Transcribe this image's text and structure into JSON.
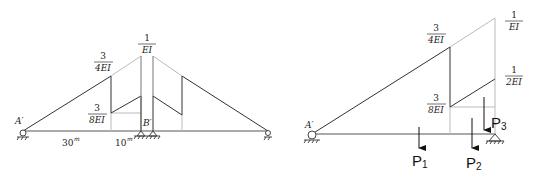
{
  "left_diagram": {
    "labels": {
      "peak": {
        "num": "1",
        "den": "EI"
      },
      "upper": {
        "num": "3",
        "den": "4EI"
      },
      "lower": {
        "num": "3",
        "den": "8EI"
      },
      "support_left": "A′",
      "support_mid": "B′"
    },
    "dimensions": [
      {
        "value": "30",
        "unit": "m"
      },
      {
        "value": "10",
        "unit": "m"
      }
    ]
  },
  "right_diagram": {
    "labels": {
      "peak": {
        "num": "1",
        "den": "EI"
      },
      "upper": {
        "num": "3",
        "den": "4EI"
      },
      "lower": {
        "num": "3",
        "den": "8EI"
      },
      "right_mid": {
        "num": "1",
        "den": "2EI"
      },
      "support_left": "A′"
    },
    "loads": [
      {
        "name": "P",
        "sub": "1"
      },
      {
        "name": "P",
        "sub": "2"
      },
      {
        "name": "P",
        "sub": "3"
      }
    ]
  }
}
